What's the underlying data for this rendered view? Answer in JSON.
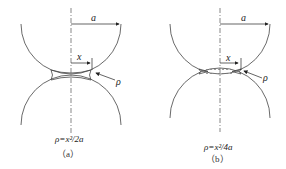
{
  "panels": [
    {
      "id": "a",
      "radius_label": "a",
      "x_label": "x",
      "rho_label": "ρ",
      "formula": "ρ=x²/2a",
      "caption": "（a）"
    },
    {
      "id": "b",
      "radius_label": "a",
      "x_label": "x",
      "rho_label": "ρ",
      "formula": "ρ=x²/4a",
      "caption": "（b）"
    }
  ]
}
